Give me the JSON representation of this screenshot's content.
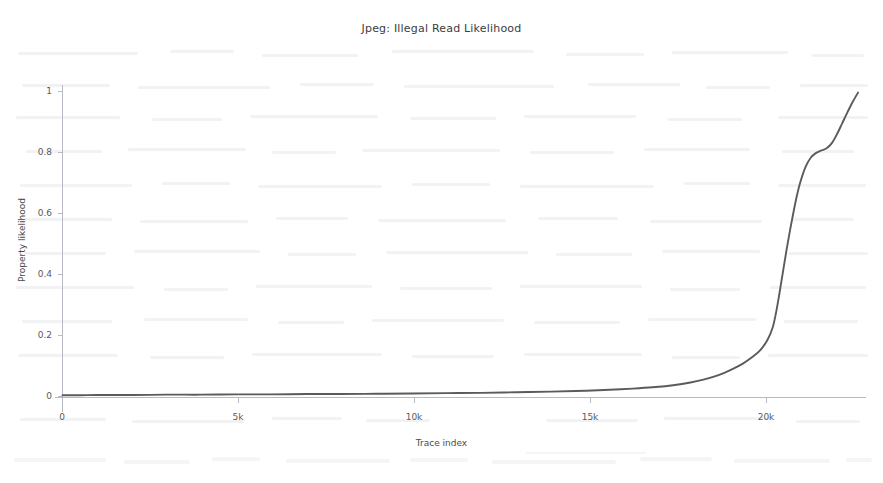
{
  "chart_data": {
    "type": "line",
    "title": "Jpeg: Illegal Read Likelihood",
    "xlabel": "Trace index",
    "ylabel": "Property likelihood",
    "xlim": [
      0,
      22800
    ],
    "ylim": [
      0,
      1.02
    ],
    "grid": false,
    "legend": null,
    "line_color": "#5b5b5b",
    "axis_color": "#b9b9c3",
    "x_ticks": [
      {
        "value": 0,
        "label": "0"
      },
      {
        "value": 5000,
        "label": "5k"
      },
      {
        "value": 10000,
        "label": "10k"
      },
      {
        "value": 15000,
        "label": "15k"
      },
      {
        "value": 20000,
        "label": "20k"
      }
    ],
    "y_ticks": [
      {
        "value": 0,
        "label": "0"
      },
      {
        "value": 0.2,
        "label": "0.2"
      },
      {
        "value": 0.4,
        "label": "0.4"
      },
      {
        "value": 0.6,
        "label": "0.6"
      },
      {
        "value": 0.8,
        "label": "0.8"
      },
      {
        "value": 1,
        "label": "1"
      }
    ],
    "series": [
      {
        "name": "Illegal read likelihood",
        "x": [
          0,
          500,
          1000,
          2000,
          3000,
          4000,
          5000,
          6000,
          7000,
          8000,
          9000,
          10000,
          11000,
          12000,
          13000,
          14000,
          15000,
          16000,
          16500,
          17000,
          17500,
          18000,
          18400,
          18800,
          19200,
          19500,
          19800,
          20000,
          20200,
          20350,
          20450,
          20550,
          20650,
          20750,
          20850,
          20950,
          21050,
          21150,
          21300,
          21450,
          21600,
          21750,
          21900,
          22050,
          22200,
          22350,
          22500,
          22650,
          22800
        ],
        "y": [
          0.004,
          0.004,
          0.005,
          0.005,
          0.006,
          0.006,
          0.007,
          0.007,
          0.008,
          0.008,
          0.009,
          0.01,
          0.011,
          0.012,
          0.014,
          0.016,
          0.019,
          0.024,
          0.027,
          0.031,
          0.037,
          0.046,
          0.056,
          0.07,
          0.09,
          0.108,
          0.132,
          0.152,
          0.185,
          0.225,
          0.275,
          0.34,
          0.41,
          0.48,
          0.545,
          0.605,
          0.66,
          0.705,
          0.755,
          0.785,
          0.8,
          0.808,
          0.815,
          0.832,
          0.862,
          0.898,
          0.934,
          0.968,
          0.998
        ]
      }
    ]
  }
}
